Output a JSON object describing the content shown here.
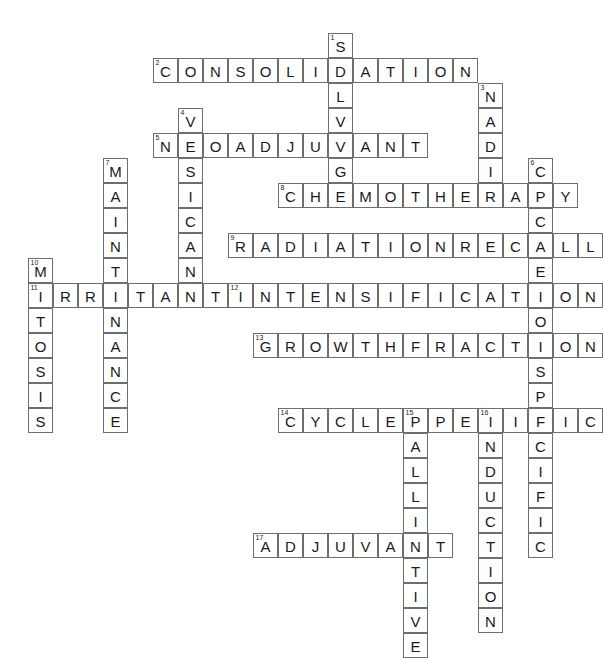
{
  "puzzle": {
    "title": "Chemotherapy Crossword Grid",
    "grid": {
      "cell_size": 25,
      "origin_x": 28,
      "origin_y": 33,
      "columns": 22,
      "rows": 25,
      "cell_fill": "#ffffff",
      "cell_border": "#6e6e6e",
      "letter_color": "#1a1a1a",
      "number_color": "#1a1a1a"
    },
    "entries": [
      {
        "number": 1,
        "direction": "down",
        "answer": "SALVAGE",
        "row": 0,
        "col": 12
      },
      {
        "number": 2,
        "direction": "across",
        "answer": "CONSOLIDATION",
        "row": 1,
        "col": 5
      },
      {
        "number": 3,
        "direction": "down",
        "answer": "NADIR",
        "row": 2,
        "col": 18
      },
      {
        "number": 4,
        "direction": "down",
        "answer": "VESICANT",
        "row": 3,
        "col": 6
      },
      {
        "number": 5,
        "direction": "across",
        "answer": "NEOADJUVANT",
        "row": 4,
        "col": 5
      },
      {
        "number": 6,
        "direction": "down",
        "answer": "CYCLENONSPECIFIC",
        "row": 5,
        "col": 20
      },
      {
        "number": 7,
        "direction": "down",
        "answer": "MAINTENANCE",
        "row": 5,
        "col": 3
      },
      {
        "number": 8,
        "direction": "across",
        "answer": "CHEMOTHERAPY",
        "row": 6,
        "col": 10
      },
      {
        "number": 9,
        "direction": "across",
        "answer": "RADIATIONRECALL",
        "row": 8,
        "col": 8
      },
      {
        "number": 10,
        "direction": "down",
        "answer": "MITOSIS",
        "row": 9,
        "col": 0
      },
      {
        "number": 11,
        "direction": "across",
        "answer": "IRRITANT",
        "row": 10,
        "col": 0
      },
      {
        "number": 12,
        "direction": "across",
        "answer": "INTENSIFICATION",
        "row": 10,
        "col": 8
      },
      {
        "number": 13,
        "direction": "across",
        "answer": "GROWTHFRACTION",
        "row": 12,
        "col": 9
      },
      {
        "number": 14,
        "direction": "across",
        "answer": "CYCLESPECIFIC",
        "row": 15,
        "col": 10
      },
      {
        "number": 15,
        "direction": "down",
        "answer": "PALLIATIVE",
        "row": 15,
        "col": 15
      },
      {
        "number": 16,
        "direction": "down",
        "answer": "INDUCTION",
        "row": 15,
        "col": 18
      },
      {
        "number": 17,
        "direction": "across",
        "answer": "ADJUVANT",
        "row": 20,
        "col": 9
      }
    ]
  }
}
